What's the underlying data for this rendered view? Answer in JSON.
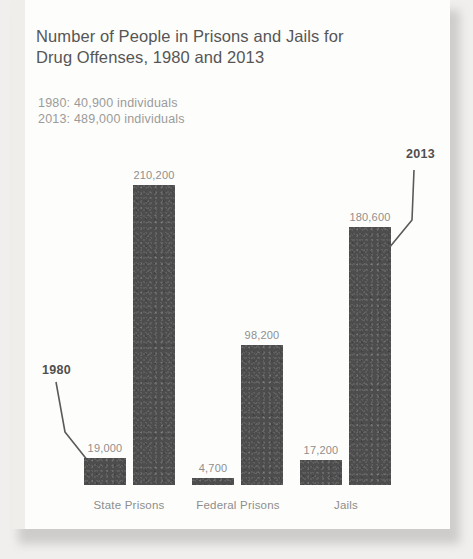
{
  "card": {
    "title": "Number of People in Prisons and Jails for\nDrug Offenses, 1980 and 2013",
    "subtitle": "1980: 40,900 individuals\n2013: 489,000 individuals",
    "subtitle_lines": [
      "1980: 40,900 individuals",
      "2013: 489,000 individuals"
    ],
    "background_color": "#fdfdfc",
    "page_background_color": "#f0efee"
  },
  "annotations": [
    {
      "id": "ann-1980",
      "label": "1980",
      "x": 30,
      "y": 363,
      "points_to": "state-prisons-1980-bar"
    },
    {
      "id": "ann-2013",
      "label": "2013",
      "x": 394,
      "y": 147,
      "points_to": "jails-2013-bar"
    }
  ],
  "chart_data": {
    "type": "bar",
    "title": "Number of People in Prisons and Jails for Drug Offenses, 1980 and 2013",
    "subtitle": "1980: 40,900 individuals; 2013: 489,000 individuals",
    "xlabel": "",
    "ylabel": "",
    "ylim": [
      0,
      215000
    ],
    "grid": false,
    "legend_position": "annotated-callouts",
    "bar_color": "#4d4d4d",
    "categories": [
      "State Prisons",
      "Federal Prisons",
      "Jails"
    ],
    "series": [
      {
        "name": "1980",
        "values": [
          19000,
          4700,
          17200
        ],
        "labels": [
          "19,000",
          "4,700",
          "17,200"
        ]
      },
      {
        "name": "2013",
        "values": [
          210200,
          98200,
          180600
        ],
        "labels": [
          "210,200",
          "98,200",
          "180,600"
        ]
      }
    ],
    "totals": {
      "1980": 40900,
      "2013": 489000
    },
    "bars": [
      {
        "name": "state-prisons-1980-bar",
        "category": "State Prisons",
        "series": "1980",
        "value": 19000,
        "label": "19,000",
        "x": 72,
        "width": 42
      },
      {
        "name": "state-prisons-2013-bar",
        "category": "State Prisons",
        "series": "2013",
        "value": 210200,
        "label": "210,200",
        "x": 121,
        "width": 42
      },
      {
        "name": "federal-prisons-1980-bar",
        "category": "Federal Prisons",
        "series": "1980",
        "value": 4700,
        "label": "4,700",
        "x": 180,
        "width": 42
      },
      {
        "name": "federal-prisons-2013-bar",
        "category": "Federal Prisons",
        "series": "2013",
        "value": 98200,
        "label": "98,200",
        "x": 229,
        "width": 42
      },
      {
        "name": "jails-1980-bar",
        "category": "Jails",
        "series": "1980",
        "value": 17200,
        "label": "17,200",
        "x": 288,
        "width": 42
      },
      {
        "name": "jails-2013-bar",
        "category": "Jails",
        "series": "2013",
        "value": 180600,
        "label": "180,600",
        "x": 337,
        "width": 42
      }
    ],
    "category_positions": [
      {
        "label": "State Prisons",
        "center": 117
      },
      {
        "label": "Federal Prisons",
        "center": 226
      },
      {
        "label": "Jails",
        "center": 334
      }
    ],
    "baseline_y": 485,
    "max_bar_top_y": 185
  }
}
